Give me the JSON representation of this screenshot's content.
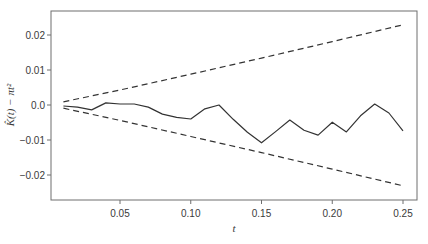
{
  "chart_data": {
    "type": "line",
    "title": "",
    "xlabel": "t",
    "ylabel": "K̂(t) − πt²",
    "xlim": [
      0.0,
      0.26
    ],
    "ylim": [
      -0.027,
      0.027
    ],
    "grid": false,
    "legend": null,
    "x_ticks": [
      0.05,
      0.1,
      0.15,
      0.2,
      0.25
    ],
    "x_tick_labels": [
      "0.05",
      "0.10",
      "0.15",
      "0.20",
      "0.25"
    ],
    "y_ticks": [
      0.02,
      0.01,
      0.0,
      -0.01,
      -0.02
    ],
    "y_tick_labels": [
      "0.02",
      "0.01",
      "0.0",
      "−0.01",
      "−0.02"
    ],
    "series": [
      {
        "name": "estimate",
        "style": "solid",
        "x": [
          0.01,
          0.02,
          0.03,
          0.04,
          0.05,
          0.06,
          0.07,
          0.08,
          0.09,
          0.1,
          0.11,
          0.12,
          0.13,
          0.14,
          0.15,
          0.16,
          0.17,
          0.18,
          0.19,
          0.2,
          0.21,
          0.22,
          0.23,
          0.24,
          0.25
        ],
        "values": [
          -0.0003,
          -0.0006,
          -0.0014,
          0.0006,
          0.0003,
          0.0003,
          -0.0006,
          -0.0026,
          -0.0035,
          -0.004,
          -0.0011,
          0.0,
          -0.0041,
          -0.0078,
          -0.0108,
          -0.0076,
          -0.0043,
          -0.0072,
          -0.0086,
          -0.0049,
          -0.0077,
          -0.0031,
          0.0003,
          -0.0023,
          -0.0074
        ]
      },
      {
        "name": "upper envelope",
        "style": "dashed",
        "x": [
          0.01,
          0.05,
          0.1,
          0.15,
          0.2,
          0.25
        ],
        "values": [
          0.0009,
          0.0043,
          0.0088,
          0.0134,
          0.0181,
          0.0229
        ]
      },
      {
        "name": "lower envelope",
        "style": "dashed",
        "x": [
          0.01,
          0.05,
          0.1,
          0.15,
          0.2,
          0.25
        ],
        "values": [
          -0.0009,
          -0.0044,
          -0.009,
          -0.0136,
          -0.0183,
          -0.0231
        ]
      }
    ]
  },
  "colors": {
    "line": "#333333",
    "frame": "#6e6e6e",
    "text": "#3a3a3a"
  }
}
